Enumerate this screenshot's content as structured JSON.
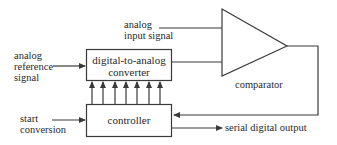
{
  "diagram": {
    "type": "successive-approximation ADC block diagram",
    "stroke_color": "#3a3a3a",
    "blocks": {
      "dac": {
        "line1": "digital-to-analog",
        "line2": "converter"
      },
      "controller": {
        "label": "controller"
      },
      "comparator": {
        "label": "comparator"
      }
    },
    "signals": {
      "analog_input": {
        "line1": "analog",
        "line2": "input signal"
      },
      "analog_reference": {
        "line1": "analog",
        "line2": "reference",
        "line3": "signal"
      },
      "start_conversion": {
        "line1": "start",
        "line2": "conversion"
      },
      "serial_output": {
        "label": "serial digital output"
      }
    },
    "bus_arrow_count": 7
  }
}
